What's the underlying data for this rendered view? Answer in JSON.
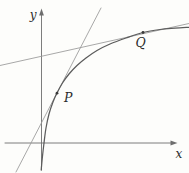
{
  "figure": {
    "type": "math-diagram-curve-with-tangents",
    "labels": {
      "y_axis": "y",
      "x_axis": "x",
      "point_p": "P",
      "point_q": "Q"
    },
    "colors": {
      "background": "#fdfdfb",
      "axis": "#6e6e6e",
      "curve": "#5c5c5c",
      "tangent_line": "#989898",
      "marker": "#3a3a3a",
      "text": "#2b2b2b"
    },
    "geometry": {
      "canvas": {
        "width": 189,
        "height": 173
      },
      "x_axis": {
        "x1": 5,
        "x2": 171.5,
        "y": 143,
        "arrow": [
          [
            177.5,
            143
          ],
          [
            170.5,
            140.6
          ],
          [
            170.5,
            145.4
          ]
        ]
      },
      "y_axis": {
        "x": 41.5,
        "y1": 15,
        "y2": 170,
        "arrow": [
          [
            41.5,
            8.5
          ],
          [
            39.1,
            15.5
          ],
          [
            43.9,
            15.5
          ]
        ]
      },
      "curve_points": [
        [
          41.2,
          170
        ],
        [
          42.3,
          158
        ],
        [
          44,
          143
        ],
        [
          46,
          128
        ],
        [
          49,
          114
        ],
        [
          53,
          102
        ],
        [
          57,
          93
        ],
        [
          62.5,
          83
        ],
        [
          69,
          74
        ],
        [
          77,
          65.5
        ],
        [
          86,
          58
        ],
        [
          97,
          50.5
        ],
        [
          110,
          44
        ],
        [
          126,
          38
        ],
        [
          143,
          32.5
        ],
        [
          160,
          29.5
        ],
        [
          175,
          28.2
        ],
        [
          189,
          27.3
        ]
      ],
      "tangent_at_p": {
        "x1": 16,
        "y1": 172,
        "x2": 101,
        "y2": 8
      },
      "tangent_at_q": {
        "x1": 0,
        "y1": 65.5,
        "x2": 189,
        "y2": 23.5
      },
      "marker_radius": 1.4,
      "points": {
        "p": {
          "x": 57,
          "y": 93.2
        },
        "q": {
          "x": 143,
          "y": 32.5
        }
      },
      "text_anchors": {
        "y_label": {
          "x": 36.5,
          "y": 19
        },
        "x_label": {
          "x": 179,
          "y": 157.5
        },
        "p_label": {
          "x": 64,
          "y": 102
        },
        "q_label": {
          "x": 135.5,
          "y": 47
        }
      }
    }
  }
}
